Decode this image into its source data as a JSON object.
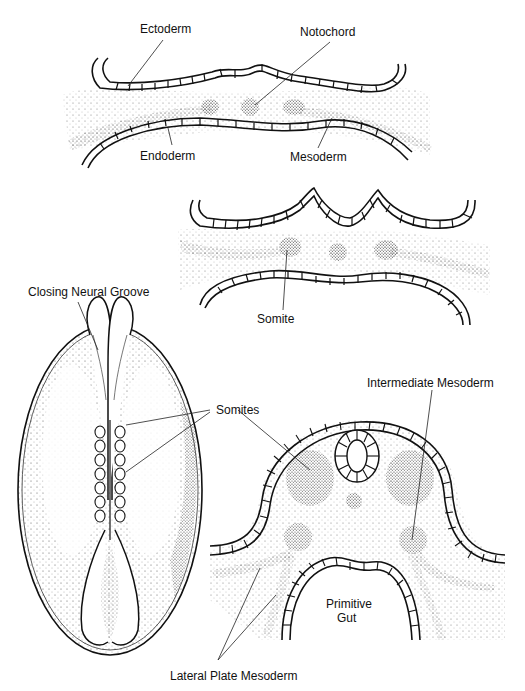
{
  "figure": {
    "panels": [
      {
        "id": "panel-a",
        "description": "Cross-section of trilaminar embryonic disc"
      },
      {
        "id": "panel-b",
        "description": "Cross-section showing somite formation"
      },
      {
        "id": "panel-c",
        "description": "Dorsal view of embryo with closing neural groove"
      },
      {
        "id": "panel-d",
        "description": "Cross-section showing neural tube, somites and primitive gut"
      }
    ],
    "labels": {
      "ectoderm": "Ectoderm",
      "notochord": "Notochord",
      "endoderm": "Endoderm",
      "mesoderm": "Mesoderm",
      "somite": "Somite",
      "closing_neural_groove": "Closing Neural Groove",
      "somites": "Somites",
      "intermediate_mesoderm": "Intermediate Mesoderm",
      "primitive_gut_line1": "Primitive",
      "primitive_gut_line2": "Gut",
      "lateral_plate_mesoderm": "Lateral Plate Mesoderm"
    }
  }
}
